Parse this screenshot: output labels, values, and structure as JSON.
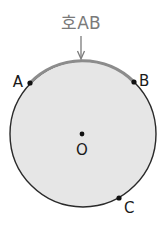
{
  "diagram": {
    "title": "호AB",
    "circle": {
      "cx": 83,
      "cy": 134,
      "r": 73,
      "fill": "#e6e6e6",
      "stroke": "#2a2a2a"
    },
    "arc": {
      "label": "호AB",
      "color": "#8c8c8c"
    },
    "center": {
      "label": "O"
    },
    "points": [
      {
        "label": "A"
      },
      {
        "label": "B"
      },
      {
        "label": "C"
      }
    ]
  }
}
